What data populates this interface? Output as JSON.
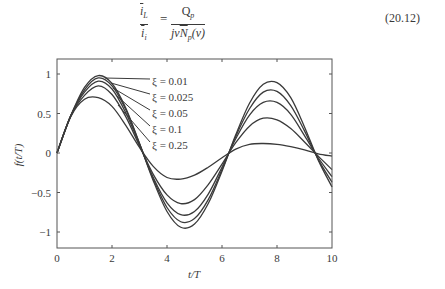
{
  "equation": {
    "lhs_num_symbol": "i",
    "lhs_num_sub": "L",
    "lhs_den_symbol": "i",
    "lhs_den_sub": "i",
    "equals": "=",
    "rhs_num_symbol": "Q",
    "rhs_num_sub": "p",
    "rhs_den_prefix": "jν",
    "rhs_den_symbol": "N",
    "rhs_den_sub": "p",
    "rhs_den_suffix": "(ν)",
    "number": "(20.12)"
  },
  "chart_data": {
    "type": "line",
    "title": "",
    "xlabel": "t/T",
    "ylabel": "f(t/T)",
    "xlim": [
      0,
      10
    ],
    "ylim": [
      -1.2,
      1.2
    ],
    "xticks": [
      0,
      2,
      4,
      6,
      8,
      10
    ],
    "xtick_labels": [
      "0",
      "2",
      "4",
      "6",
      "8",
      "10"
    ],
    "yticks": [
      1,
      0.5,
      0,
      -0.5,
      -1
    ],
    "ytick_labels": [
      "1",
      "0.5",
      "0",
      "−0.5",
      "−1"
    ],
    "grid": false,
    "legend_position": "inline labels with leader lines, upper-left",
    "x": [
      0,
      0.5,
      1,
      1.5,
      2,
      2.5,
      3,
      3.5,
      4,
      4.5,
      5,
      5.5,
      6,
      6.5,
      7,
      7.5,
      8,
      8.5,
      9,
      9.5,
      10
    ],
    "series": [
      {
        "name": "ξ = 0.01",
        "values": [
          0,
          0.47,
          0.83,
          0.98,
          0.88,
          0.57,
          0.12,
          -0.35,
          -0.74,
          -0.94,
          -0.9,
          -0.64,
          -0.23,
          0.23,
          0.63,
          0.87,
          0.89,
          0.7,
          0.33,
          -0.09,
          -0.43
        ],
        "label_start": [
          105,
          78
        ],
        "label_end": [
          150,
          79
        ],
        "label_y": 81
      },
      {
        "name": "ξ = 0.025",
        "values": [
          0,
          0.47,
          0.8,
          0.95,
          0.85,
          0.55,
          0.12,
          -0.33,
          -0.69,
          -0.87,
          -0.83,
          -0.59,
          -0.21,
          0.21,
          0.56,
          0.77,
          0.78,
          0.6,
          0.28,
          -0.08,
          -0.37
        ],
        "label_start": [
          111,
          83
        ],
        "label_end": [
          150,
          94
        ],
        "label_y": 97
      },
      {
        "name": "ξ = 0.05",
        "values": [
          0,
          0.47,
          0.77,
          0.91,
          0.81,
          0.51,
          0.11,
          -0.31,
          -0.63,
          -0.78,
          -0.74,
          -0.52,
          -0.18,
          0.18,
          0.48,
          0.64,
          0.64,
          0.49,
          0.22,
          -0.06,
          -0.3
        ],
        "label_start": [
          113,
          88
        ],
        "label_end": [
          150,
          110
        ],
        "label_y": 113
      },
      {
        "name": "ξ = 0.1",
        "values": [
          0,
          0.47,
          0.73,
          0.85,
          0.74,
          0.46,
          0.09,
          -0.27,
          -0.53,
          -0.64,
          -0.59,
          -0.4,
          -0.14,
          0.13,
          0.34,
          0.44,
          0.42,
          0.31,
          0.14,
          -0.04,
          -0.21
        ],
        "label_start": [
          116,
          95
        ],
        "label_end": [
          150,
          126
        ],
        "label_y": 129
      },
      {
        "name": "ξ = 0.25",
        "values": [
          0,
          0.46,
          0.68,
          0.7,
          0.59,
          0.35,
          0.07,
          -0.17,
          -0.31,
          -0.33,
          -0.28,
          -0.18,
          -0.06,
          0.05,
          0.11,
          0.12,
          0.11,
          0.08,
          0.04,
          -0.01,
          -0.04
        ],
        "label_start": [
          118,
          105
        ],
        "label_end": [
          150,
          142
        ],
        "label_y": 145
      }
    ],
    "line_color": "#3a3a3a"
  }
}
